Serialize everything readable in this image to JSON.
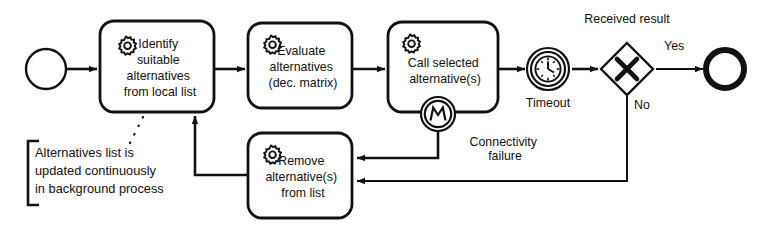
{
  "diagram": {
    "type": "bpmn-process-flow",
    "colors": {
      "stroke": "#111111",
      "fill": "#ffffff",
      "background": "#ffffff"
    },
    "start_event": {
      "name": "start-event",
      "shape": "circle-thin"
    },
    "end_event": {
      "name": "end-event",
      "shape": "circle-thick"
    },
    "tasks": [
      {
        "id": "identify",
        "marker": "service-task-gear",
        "lines": [
          "Identify",
          "suitable",
          "alternatives",
          "from local list"
        ]
      },
      {
        "id": "evaluate",
        "marker": "service-task-gear",
        "lines": [
          "Evaluate",
          "alternatives",
          "(dec. matrix)"
        ]
      },
      {
        "id": "call",
        "marker": "service-task-gear",
        "lines": [
          "Call selected",
          "alternative(s)"
        ]
      },
      {
        "id": "remove",
        "marker": "service-task-gear",
        "lines": [
          "Remove",
          "alternative(s)",
          "from list"
        ]
      }
    ],
    "events": [
      {
        "id": "error-event",
        "kind": "boundary-error",
        "glyph": "lightning-zigzag",
        "label_lines": [
          "Connectivity",
          "failure"
        ]
      },
      {
        "id": "timer-event",
        "kind": "intermediate-timer",
        "glyph": "clock",
        "label_lines": [
          "Timeout"
        ]
      }
    ],
    "gateway": {
      "id": "received-result-gateway",
      "kind": "exclusive",
      "glyph": "X",
      "label": "Received result"
    },
    "flow_labels": [
      {
        "id": "yes",
        "text": "Yes"
      },
      {
        "id": "no",
        "text": "No"
      }
    ],
    "annotation": {
      "id": "background-process-note",
      "lines": [
        "Alternatives list is",
        "updated continuously",
        "in background process"
      ]
    }
  }
}
